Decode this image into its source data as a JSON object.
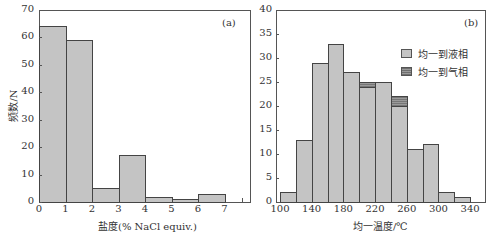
{
  "chart_data": [
    {
      "panel": "(a)",
      "type": "bar",
      "title": "",
      "xlabel": "盐度(% NaCl equiv.)",
      "ylabel": "频数/N",
      "bin_edges": [
        0,
        1,
        2,
        3,
        4,
        5,
        6,
        7
      ],
      "categories": [
        "0-1",
        "1-2",
        "2-3",
        "3-4",
        "4-5",
        "5-6",
        "6-7"
      ],
      "values": [
        64,
        59,
        5,
        17,
        2,
        1,
        3
      ],
      "xticks": [
        "0",
        "1",
        "2",
        "3",
        "4",
        "5",
        "6",
        "7"
      ],
      "yticks": [
        "0",
        "10",
        "20",
        "30",
        "40",
        "50",
        "60",
        "70"
      ],
      "xlim": [
        0,
        8
      ],
      "ylim": [
        0,
        70
      ],
      "grid": false
    },
    {
      "panel": "(b)",
      "type": "bar",
      "stacked": true,
      "title": "",
      "xlabel": "均一温度/℃",
      "ylabel": "",
      "bin_edges": [
        100,
        120,
        140,
        160,
        180,
        200,
        220,
        240,
        260,
        280,
        300,
        320,
        340
      ],
      "categories": [
        "100-120",
        "120-140",
        "140-160",
        "160-180",
        "180-200",
        "200-220",
        "220-240",
        "240-260",
        "260-280",
        "280-300",
        "300-320",
        "320-340"
      ],
      "series": [
        {
          "name": "均一到液相",
          "values": [
            2,
            13,
            29,
            33,
            27,
            24,
            25,
            20,
            11,
            12,
            2,
            1
          ]
        },
        {
          "name": "均一到气相",
          "values": [
            0,
            0,
            0,
            0,
            0,
            1,
            0,
            2,
            0,
            0,
            0,
            0
          ]
        }
      ],
      "xticks": [
        "100",
        "140",
        "180",
        "220",
        "260",
        "300",
        "340"
      ],
      "yticks": [
        "0",
        "5",
        "10",
        "15",
        "20",
        "25",
        "30",
        "35",
        "40"
      ],
      "xlim": [
        95,
        360
      ],
      "ylim": [
        0,
        40
      ],
      "legend_position": "upper right",
      "grid": false
    }
  ],
  "panels": {
    "a": {
      "tag": "(a)",
      "xlabel": "盐度(% NaCl equiv.)",
      "ylabel": "频数/N"
    },
    "b": {
      "tag": "(b)",
      "xlabel": "均一温度/℃",
      "legend": [
        "均一到液相",
        "均一到气相"
      ]
    }
  },
  "colors": {
    "liquid": "#c4c4c4",
    "vapor": "#8a8a8a",
    "axis": "#555555"
  }
}
